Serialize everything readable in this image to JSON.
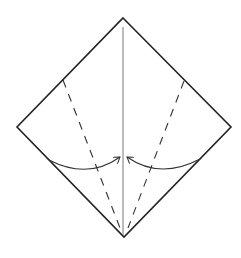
{
  "diagram": {
    "type": "origami-fold-step",
    "colors": {
      "background": "#ffffff",
      "outline": "#222222",
      "center_crease": "#777777",
      "valley_fold": "#333333",
      "arrow": "#333333"
    },
    "paper": {
      "vertices": {
        "top": [
          123,
          18
        ],
        "right": [
          231,
          127
        ],
        "bottom": [
          124,
          237
        ],
        "left": [
          17,
          127
        ]
      }
    },
    "center_crease": {
      "from": [
        123,
        27
      ],
      "to": [
        123,
        235
      ]
    },
    "valley_folds": [
      {
        "name": "left",
        "from": [
          63,
          80
        ],
        "to": [
          120,
          228
        ]
      },
      {
        "name": "right",
        "from": [
          184,
          81
        ],
        "to": [
          128,
          228
        ]
      }
    ],
    "arrows": [
      {
        "name": "left-fold-arrow",
        "from": [
          49,
          160
        ],
        "to": [
          120,
          157
        ],
        "direction": "right"
      },
      {
        "name": "right-fold-arrow",
        "from": [
          200,
          159
        ],
        "to": [
          127,
          157
        ],
        "direction": "left"
      }
    ]
  }
}
